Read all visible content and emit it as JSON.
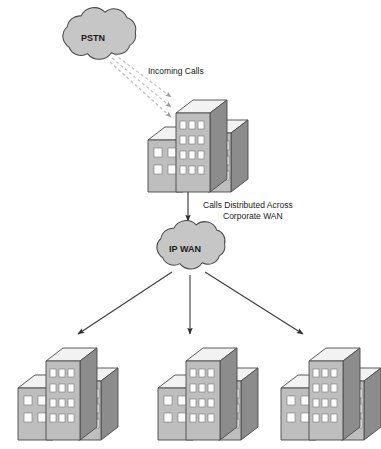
{
  "diagram": {
    "background_color": "#ffffff",
    "nodes": {
      "pstn_cloud": {
        "label": "PSTN",
        "type": "cloud",
        "fill_color": "#c6c6c6",
        "stroke_color": "#4a4a4a",
        "cx": 93,
        "cy": 38
      },
      "ip_wan_cloud": {
        "label": "IP WAN",
        "type": "cloud",
        "fill_color": "#c6c6c6",
        "stroke_color": "#4a4a4a",
        "cx": 185,
        "cy": 249
      },
      "headquarters_building": {
        "label": "",
        "type": "building",
        "x": 148,
        "y": 100
      },
      "branch_building_left": {
        "label": "",
        "type": "building",
        "x": 18,
        "y": 338
      },
      "branch_building_center": {
        "label": "",
        "type": "building",
        "x": 158,
        "y": 338
      },
      "branch_building_right": {
        "label": "",
        "type": "building",
        "x": 288,
        "y": 338
      }
    },
    "labels": {
      "incoming_calls": "Incoming Calls",
      "calls_distributed_line1": "Calls Distributed Across",
      "calls_distributed_line2": "Corporate WAN"
    },
    "connections": [
      {
        "name": "pstn-to-headquarters",
        "style": "dashed",
        "color": "#b9b9b9",
        "count": 3,
        "from": "pstn_cloud",
        "to": "headquarters_building"
      },
      {
        "name": "headquarters-to-ipwan",
        "style": "solid",
        "color": "#3a3a3a",
        "count": 1,
        "from": "headquarters_building",
        "to": "ip_wan_cloud"
      },
      {
        "name": "ipwan-to-branches",
        "style": "solid",
        "color": "#3a3a3a",
        "count": 3,
        "from": "ip_wan_cloud",
        "to": "branch_buildings"
      }
    ],
    "building_colors": {
      "roof": "#f2f2f2",
      "front": "#bebebe",
      "side": "#8c8c8c",
      "window": "#fbfbfb",
      "outline": "#4a4a4a"
    }
  }
}
